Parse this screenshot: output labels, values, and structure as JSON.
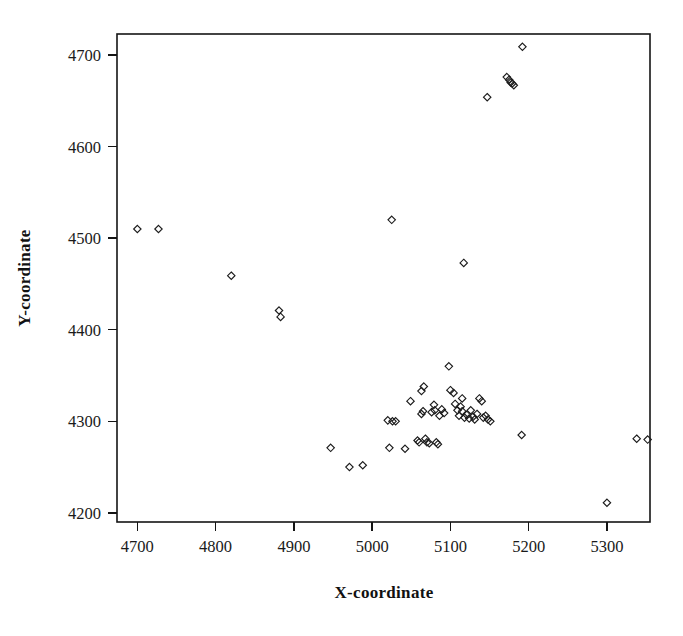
{
  "chart_data": {
    "type": "scatter",
    "title": "",
    "xlabel": "X-coordinate",
    "ylabel": "Y-coordinate",
    "xlim": [
      4674,
      5355
    ],
    "ylim": [
      4190,
      4723
    ],
    "xticks": [
      4700,
      4800,
      4900,
      5000,
      5100,
      5200,
      5300
    ],
    "yticks": [
      4200,
      4300,
      4400,
      4500,
      4600,
      4700
    ],
    "grid": false,
    "legend": null,
    "marker": "open-diamond",
    "marker_color": "#1c1c1c",
    "n_points": 64,
    "points": [
      [
        4700,
        4510
      ],
      [
        4727,
        4510
      ],
      [
        4820,
        4459
      ],
      [
        4881,
        4421
      ],
      [
        4883,
        4414
      ],
      [
        4947,
        4271
      ],
      [
        4971,
        4250
      ],
      [
        4988,
        4252
      ],
      [
        5025,
        4520
      ],
      [
        5020,
        4301
      ],
      [
        5026,
        4300
      ],
      [
        5030,
        4300
      ],
      [
        5022,
        4271
      ],
      [
        5042,
        4270
      ],
      [
        5049,
        4322
      ],
      [
        5058,
        4279
      ],
      [
        5060,
        4277
      ],
      [
        5063,
        4333
      ],
      [
        5066,
        4338
      ],
      [
        5065,
        4311
      ],
      [
        5063,
        4308
      ],
      [
        5068,
        4281
      ],
      [
        5070,
        4277
      ],
      [
        5073,
        4276
      ],
      [
        5076,
        4310
      ],
      [
        5079,
        4318
      ],
      [
        5080,
        4312
      ],
      [
        5082,
        4277
      ],
      [
        5084,
        4275
      ],
      [
        5086,
        4306
      ],
      [
        5089,
        4313
      ],
      [
        5092,
        4309
      ],
      [
        5098,
        4360
      ],
      [
        5100,
        4334
      ],
      [
        5104,
        4331
      ],
      [
        5106,
        4319
      ],
      [
        5109,
        4312
      ],
      [
        5111,
        4306
      ],
      [
        5113,
        4316
      ],
      [
        5115,
        4311
      ],
      [
        5117,
        4473
      ],
      [
        5115,
        4325
      ],
      [
        5118,
        4304
      ],
      [
        5121,
        4307
      ],
      [
        5124,
        4303
      ],
      [
        5126,
        4312
      ],
      [
        5129,
        4305
      ],
      [
        5131,
        4302
      ],
      [
        5134,
        4308
      ],
      [
        5137,
        4325
      ],
      [
        5140,
        4322
      ],
      [
        5142,
        4304
      ],
      [
        5145,
        4306
      ],
      [
        5148,
        4302
      ],
      [
        5151,
        4300
      ],
      [
        5147,
        4654
      ],
      [
        5172,
        4676
      ],
      [
        5175,
        4673
      ],
      [
        5177,
        4670
      ],
      [
        5179,
        4669
      ],
      [
        5181,
        4667
      ],
      [
        5191,
        4285
      ],
      [
        5192,
        4709
      ],
      [
        5300,
        4211
      ],
      [
        5338,
        4281
      ],
      [
        5352,
        4280
      ]
    ]
  },
  "figure": {
    "background_color": "#ffffff",
    "frame_color": "#141414"
  }
}
